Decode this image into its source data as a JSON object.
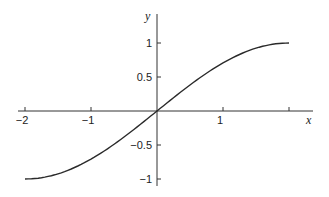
{
  "chart_data": {
    "type": "line",
    "title": "",
    "xlabel": "x",
    "ylabel": "y",
    "xlim": [
      -2,
      2.3
    ],
    "ylim": [
      -1,
      1.3
    ],
    "grid": false,
    "legend": null,
    "x_ticks": [
      -2,
      -1,
      1,
      2
    ],
    "x_tick_labels": [
      "−2",
      "−1",
      "1",
      ""
    ],
    "y_ticks": [
      1,
      0.5,
      -0.5,
      -1
    ],
    "y_tick_labels": [
      "1",
      "0.5",
      "−0.5",
      "−1"
    ],
    "series": [
      {
        "name": "y = sin(πx/4)",
        "x": [
          -2,
          -1.5,
          -1,
          -0.5,
          0,
          0.5,
          1,
          1.5,
          2
        ],
        "values": [
          -1,
          -0.924,
          -0.707,
          -0.383,
          0,
          0.383,
          0.707,
          0.924,
          1
        ]
      }
    ]
  }
}
